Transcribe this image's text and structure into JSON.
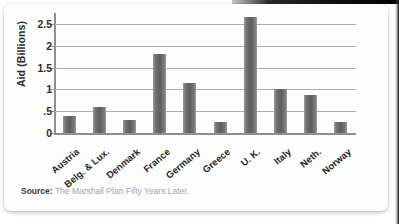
{
  "card": {
    "source": {
      "label": "Source:",
      "text": "The Marshall Plan Fifty Years Later."
    }
  },
  "chart_data": {
    "type": "bar",
    "title": "",
    "xlabel": "",
    "ylabel": "Aid (Billions)",
    "ylim": [
      0,
      2.75
    ],
    "yticks": [
      0,
      0.5,
      1,
      1.5,
      2,
      2.5
    ],
    "ytick_labels": [
      "0",
      ".5",
      "1",
      "1.5",
      "2",
      "2.5"
    ],
    "grid": true,
    "legend": false,
    "bar_color": "#6f6f6f",
    "categories": [
      "Austria",
      "Belg. & Lux.",
      "Denmark",
      "France",
      "Germany",
      "Greece",
      "U. K.",
      "Italy",
      "Neth.",
      "Norway"
    ],
    "values": [
      0.4,
      0.6,
      0.3,
      1.8,
      1.15,
      0.25,
      2.65,
      1.0,
      0.88,
      0.25
    ]
  }
}
